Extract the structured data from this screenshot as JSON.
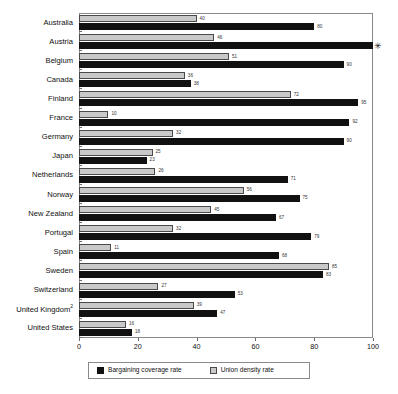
{
  "chart_data": {
    "type": "bar",
    "orientation": "horizontal",
    "title": "",
    "subtitle": "",
    "xlabel": "",
    "ylabel": "",
    "xlim": [
      0,
      100
    ],
    "xticks": [
      0,
      20,
      40,
      60,
      80,
      100
    ],
    "xtick_labels": [
      "0",
      "20",
      "40",
      "60",
      "80",
      "100"
    ],
    "grid": false,
    "legend_position": "bottom",
    "categories": [
      "Australia",
      "Austria",
      "Belgium",
      "Canada",
      "Finland",
      "France",
      "Germany",
      "Japan",
      "Netherlands",
      "Norway",
      "New Zealand",
      "Portugal",
      "Spain",
      "Sweden",
      "Switzerland",
      "United Kingdom",
      "United States"
    ],
    "category_footnotes": {
      "United Kingdom": "2"
    },
    "series": [
      {
        "name": "Bargaining coverage rate",
        "color": "#111111",
        "values": [
          80,
          100,
          90,
          38,
          95,
          92,
          90,
          23,
          71,
          75,
          67,
          79,
          68,
          83,
          53,
          47,
          18
        ],
        "value_labels": [
          "80",
          "",
          "90",
          "38",
          "95",
          "92",
          "90",
          "23",
          "71",
          "75",
          "67",
          "79",
          "68",
          "83",
          "53",
          "47",
          "18"
        ]
      },
      {
        "name": "Union density rate",
        "color": "#c9c9c9",
        "values": [
          40,
          46,
          51,
          36,
          72,
          10,
          32,
          25,
          26,
          56,
          45,
          32,
          11,
          85,
          27,
          39,
          16
        ],
        "value_labels": [
          "40",
          "46",
          "51",
          "36",
          "72",
          "10",
          "32",
          "25",
          "26",
          "56",
          "45",
          "32",
          "11",
          "85",
          "27",
          "39",
          "16"
        ]
      }
    ],
    "annotations": [
      {
        "category": "Austria",
        "series": "Bargaining coverage rate",
        "marker": "✳",
        "note": "value extends beyond axis maximum"
      }
    ],
    "legend": [
      {
        "label": "Bargaining coverage rate",
        "color": "#111111"
      },
      {
        "label": "Union density rate",
        "color": "#c9c9c9"
      }
    ]
  }
}
